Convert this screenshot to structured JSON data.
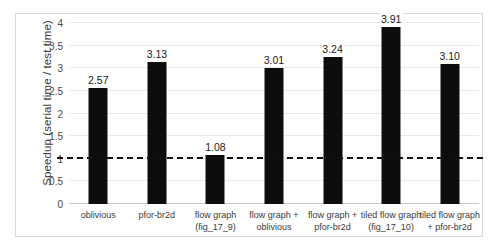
{
  "chart_data": {
    "type": "bar",
    "title": "",
    "xlabel": "",
    "ylabel": "Speedup (serial time / test time)",
    "ylim": [
      0,
      4
    ],
    "yticks": [
      "0",
      "0.5",
      "1",
      "1.5",
      "2",
      "2.5",
      "3",
      "3.5",
      "4"
    ],
    "ytick_values": [
      0,
      0.5,
      1,
      1.5,
      2,
      2.5,
      3,
      3.5,
      4
    ],
    "grid": true,
    "legend": "none",
    "bar_color": "#0d0d0d",
    "reference_line": {
      "value": 1,
      "style": "dashed",
      "color": "#111111"
    },
    "categories": [
      "oblivious",
      "pfor-br2d",
      "flow graph (fig_17_9)",
      "flow graph + oblivious",
      "flow graph + pfor-br2d",
      "tiled flow graph (fig_17_10)",
      "tiled flow graph + pfor-br2d"
    ],
    "category_lines": [
      [
        "oblivious"
      ],
      [
        "pfor-br2d"
      ],
      [
        "flow graph",
        "(fig_17_9)"
      ],
      [
        "flow graph +",
        "oblivious"
      ],
      [
        "flow graph +",
        "pfor-br2d"
      ],
      [
        "tiled flow graph",
        "(fig_17_10)"
      ],
      [
        "tiled flow graph",
        "+ pfor-br2d"
      ]
    ],
    "values": [
      2.57,
      3.13,
      1.08,
      3.01,
      3.24,
      3.91,
      3.1
    ],
    "value_labels": [
      "2.57",
      "3.13",
      "1.08",
      "3.01",
      "3.24",
      "3.91",
      "3.10"
    ]
  }
}
